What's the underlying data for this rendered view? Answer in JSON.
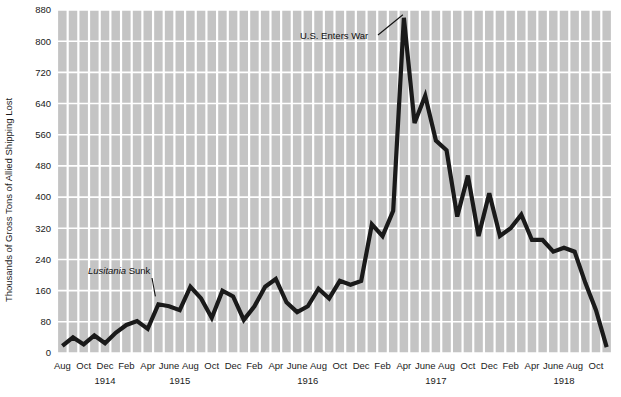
{
  "chart_data": {
    "type": "line",
    "title": "",
    "subtitle": "",
    "xlabel": "",
    "ylabel": "Thousands of Gross Tons of Allied Shipping Lost",
    "ylim": [
      0,
      880
    ],
    "ytick_step": 80,
    "yticks": [
      0,
      80,
      160,
      240,
      320,
      400,
      480,
      560,
      640,
      720,
      800,
      880
    ],
    "ytick_labels": [
      "0",
      "80",
      "160",
      "240",
      "320",
      "400",
      "480",
      "560",
      "640",
      "720",
      "800",
      "880"
    ],
    "grid": true,
    "grid_color": "#ffffff",
    "plot_background": "#c4c4c4",
    "line_color": "#1a1a1a",
    "legend": "none",
    "x_tick_interval_months": 2,
    "x_axis_note": "Monthly values, Aug 1914 through Nov 1918",
    "month_tick_labels": [
      "Aug",
      "Oct",
      "Dec",
      "Feb",
      "Apr",
      "June",
      "Aug",
      "Oct",
      "Dec",
      "Feb",
      "Apr",
      "June",
      "Aug",
      "Oct",
      "Dec",
      "Feb",
      "Apr",
      "June",
      "Aug",
      "Oct",
      "Dec",
      "Feb",
      "Apr",
      "June",
      "Aug",
      "Oct"
    ],
    "year_labels": [
      "1914",
      "1915",
      "1916",
      "1917",
      "1918"
    ],
    "year_label_positions": [
      "1914-12",
      "1915-07",
      "1916-07",
      "1917-07",
      "1918-07"
    ],
    "x": [
      "1914-08",
      "1914-09",
      "1914-10",
      "1914-11",
      "1914-12",
      "1915-01",
      "1915-02",
      "1915-03",
      "1915-04",
      "1915-05",
      "1915-06",
      "1915-07",
      "1915-08",
      "1915-09",
      "1915-10",
      "1915-11",
      "1915-12",
      "1916-01",
      "1916-02",
      "1916-03",
      "1916-04",
      "1916-05",
      "1916-06",
      "1916-07",
      "1916-08",
      "1916-09",
      "1916-10",
      "1916-11",
      "1916-12",
      "1917-01",
      "1917-02",
      "1917-03",
      "1917-04",
      "1917-05",
      "1917-06",
      "1917-07",
      "1917-08",
      "1917-09",
      "1917-10",
      "1917-11",
      "1917-12",
      "1918-01",
      "1918-02",
      "1918-03",
      "1918-04",
      "1918-05",
      "1918-06",
      "1918-07",
      "1918-08",
      "1918-09",
      "1918-10",
      "1918-11"
    ],
    "values": [
      18,
      40,
      22,
      45,
      25,
      52,
      72,
      82,
      62,
      125,
      120,
      110,
      170,
      140,
      90,
      160,
      145,
      85,
      120,
      170,
      190,
      130,
      105,
      120,
      165,
      140,
      185,
      175,
      185,
      330,
      300,
      365,
      860,
      590,
      660,
      545,
      520,
      350,
      455,
      300,
      410,
      300,
      320,
      355,
      290,
      290,
      260,
      270,
      260,
      180,
      110,
      15
    ],
    "annotations": [
      {
        "id": "lusitania",
        "text_parts": [
          {
            "text": "Lusitania",
            "style": "italic"
          },
          {
            "text": " Sunk",
            "style": "normal"
          }
        ],
        "text_plain": "Lusitania Sunk",
        "points_to": "1915-05",
        "points_to_value": 125
      },
      {
        "id": "us-enters-war",
        "text_parts": [
          {
            "text": "U.S. Enters War",
            "style": "normal"
          }
        ],
        "text_plain": "U.S. Enters War",
        "points_to": "1917-04",
        "points_to_value": 860
      }
    ]
  }
}
